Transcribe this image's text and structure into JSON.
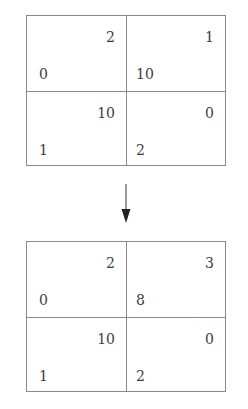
{
  "diagram": {
    "type": "payoff-matrix-transformation",
    "top_matrix": {
      "rows": [
        [
          {
            "top_right": "2",
            "bottom_left": "0"
          },
          {
            "top_right": "1",
            "bottom_left": "10"
          }
        ],
        [
          {
            "top_right": "10",
            "bottom_left": "1"
          },
          {
            "top_right": "0",
            "bottom_left": "2"
          }
        ]
      ]
    },
    "arrow": {
      "direction": "down"
    },
    "bottom_matrix": {
      "rows": [
        [
          {
            "top_right": "2",
            "bottom_left": "0"
          },
          {
            "top_right": "3",
            "bottom_left": "8"
          }
        ],
        [
          {
            "top_right": "10",
            "bottom_left": "1"
          },
          {
            "top_right": "0",
            "bottom_left": "2"
          }
        ]
      ]
    },
    "colors": {
      "line": "#8a8a8a",
      "text": "#3c3c3c",
      "arrow": "#222222"
    }
  }
}
